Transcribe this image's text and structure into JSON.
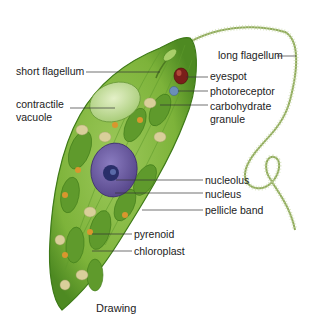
{
  "figure": {
    "caption": "Drawing",
    "colors": {
      "body": "#7db33a",
      "body_dark": "#4e8a22",
      "body_light": "#a9cf6a",
      "chloroplast": "#5f9a2c",
      "nucleus": "#6a5a9e",
      "nucleolus": "#2a2f6a",
      "eyespot": "#7a1e1a",
      "photoreceptor": "#6b8fb8",
      "granule": "#d9cf9a",
      "pyrenoid": "#d9962e",
      "flagellum": "#8faa5a",
      "leader": "#333333"
    },
    "labels": {
      "short_flagellum": "short flagellum",
      "contractile_vacuole_1": "contractile",
      "contractile_vacuole_2": "vacuole",
      "long_flagellum": "long flagellum",
      "eyespot": "eyespot",
      "photoreceptor": "photoreceptor",
      "carbohydrate_granule_1": "carbohydrate",
      "carbohydrate_granule_2": "granule",
      "nucleolus": "nucleolus",
      "nucleus": "nucleus",
      "pellicle_band": "pellicle band",
      "pyrenoid": "pyrenoid",
      "chloroplast": "chloroplast"
    }
  }
}
